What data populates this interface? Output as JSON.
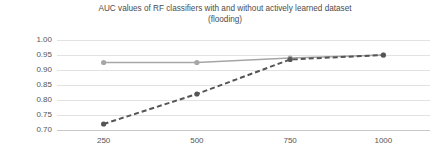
{
  "chart_data": {
    "type": "line",
    "title": "AUC values of RF classifiers with and without actively learned dataset\n(flooding)",
    "xlabel": "",
    "ylabel": "",
    "categories": [
      "250",
      "500",
      "750",
      "1000"
    ],
    "x": [
      250,
      500,
      750,
      1000
    ],
    "ylim": [
      0.7,
      1.0
    ],
    "yticks": [
      "1.00",
      "0.95",
      "0.90",
      "0.85",
      "0.80",
      "0.75",
      "0.70"
    ],
    "ytick_values": [
      1.0,
      0.95,
      0.9,
      0.85,
      0.8,
      0.75,
      0.7
    ],
    "grid": true,
    "legend": "none",
    "series": [
      {
        "name": "with actively learned dataset",
        "style": "solid",
        "color": "#a6a6a6",
        "marker": "circle",
        "values": [
          0.925,
          0.925,
          0.94,
          0.95
        ]
      },
      {
        "name": "without actively learned dataset",
        "style": "dashed",
        "color": "#555555",
        "marker": "circle",
        "values": [
          0.72,
          0.82,
          0.935,
          0.95
        ]
      }
    ]
  }
}
